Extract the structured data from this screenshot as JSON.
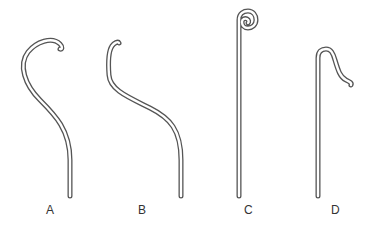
{
  "figure": {
    "stroke_color": "#555555",
    "background": "#ffffff",
    "items": [
      {
        "id": "A",
        "label": "A",
        "description": "curved wire with open hook tip"
      },
      {
        "id": "B",
        "label": "B",
        "description": "S-curved wire with small bent tip"
      },
      {
        "id": "C",
        "label": "C",
        "description": "straight wire with spiral curl at top"
      },
      {
        "id": "D",
        "label": "D",
        "description": "straight wire with shepherd-crook bent tip"
      }
    ]
  }
}
